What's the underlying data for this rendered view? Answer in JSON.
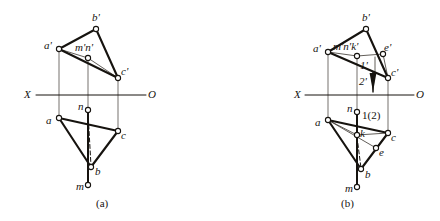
{
  "figure": {
    "ink_color": "#16130f",
    "thin_color": "#3a352e",
    "background": "#ffffff",
    "captions": [
      {
        "id": "cap-a",
        "text": "(a)",
        "x": 96,
        "y": 198
      },
      {
        "id": "cap-b",
        "text": "(b)",
        "x": 341,
        "y": 198
      }
    ]
  },
  "panels": [
    {
      "id": "panel-a",
      "caption": "(a)",
      "axis": {
        "label_left": "X",
        "label_right": "O",
        "y": 95,
        "x_start": 36,
        "x_end": 146,
        "label_left_x": 24,
        "label_left_y": 89,
        "label_right_x": 148,
        "label_right_y": 89
      },
      "upper_triangle": {
        "name": "frontal-projection-triangle",
        "vertices": [
          {
            "id": "a-prime",
            "label": "a'",
            "x": 59,
            "y": 49,
            "lx": 44,
            "ly": 40
          },
          {
            "id": "b-prime",
            "label": "b'",
            "x": 96,
            "y": 29,
            "lx": 92,
            "ly": 12
          },
          {
            "id": "c-prime",
            "label": "c'",
            "x": 118,
            "y": 78,
            "lx": 121,
            "ly": 66
          }
        ]
      },
      "lower_triangle": {
        "name": "horizontal-projection-triangle",
        "vertices": [
          {
            "id": "a-low",
            "label": "a",
            "x": 59,
            "y": 118,
            "lx": 46,
            "ly": 115
          },
          {
            "id": "b-low",
            "label": "b",
            "x": 91,
            "y": 167,
            "lx": 95,
            "ly": 166
          },
          {
            "id": "c-low",
            "label": "c",
            "x": 118,
            "y": 131,
            "lx": 121,
            "ly": 130
          }
        ]
      },
      "points": [
        {
          "id": "mn-prime",
          "label": "m'n'",
          "x": 88,
          "y": 58,
          "lx": 75,
          "ly": 42
        },
        {
          "id": "n-low",
          "label": "n",
          "x": 88,
          "y": 110,
          "lx": 78,
          "ly": 101
        },
        {
          "id": "m-low",
          "label": "m",
          "x": 88,
          "y": 185,
          "lx": 76,
          "ly": 181
        }
      ],
      "projection_lines": [
        {
          "id": "proj-a",
          "x": 59,
          "y1": 49,
          "y2": 118
        },
        {
          "id": "proj-mn",
          "x": 88,
          "y1": 58,
          "y2": 110
        },
        {
          "id": "proj-c",
          "x": 118,
          "y1": 78,
          "y2": 131
        }
      ],
      "solid_segments": [
        {
          "id": "seg-n-b",
          "x1": 88,
          "y1": 110,
          "x2": 88,
          "y2": 185
        }
      ],
      "dashed_segments": [
        {
          "id": "dash-n-b",
          "x1": 88,
          "y1": 112,
          "x2": 91,
          "y2": 166
        }
      ],
      "thin_segments": [
        {
          "id": "thin-aprime-mn-cprime",
          "pts": "59,49 88,58 118,78"
        }
      ]
    },
    {
      "id": "panel-b",
      "caption": "(b)",
      "axis": {
        "label_left": "X",
        "label_right": "O",
        "y": 95,
        "x_start": 305,
        "x_end": 414,
        "label_left_x": 294,
        "label_left_y": 89,
        "label_right_x": 416,
        "label_right_y": 89
      },
      "upper_triangle": {
        "name": "frontal-projection-triangle",
        "vertices": [
          {
            "id": "a-prime",
            "label": "a'",
            "x": 328,
            "y": 52,
            "lx": 313,
            "ly": 43
          },
          {
            "id": "b-prime",
            "label": "b'",
            "x": 366,
            "y": 29,
            "lx": 362,
            "ly": 12
          },
          {
            "id": "c-prime",
            "label": "c'",
            "x": 388,
            "y": 78,
            "lx": 391,
            "ly": 67
          }
        ]
      },
      "lower_triangle": {
        "name": "horizontal-projection-triangle",
        "vertices": [
          {
            "id": "a-low",
            "label": "a",
            "x": 328,
            "y": 120,
            "lx": 315,
            "ly": 117
          },
          {
            "id": "b-low",
            "label": "b",
            "x": 361,
            "y": 169,
            "lx": 365,
            "ly": 169
          },
          {
            "id": "c-low",
            "label": "c",
            "x": 388,
            "y": 133,
            "lx": 391,
            "ly": 132
          }
        ]
      },
      "points": [
        {
          "id": "mnk-prime",
          "label": "m'n'k'",
          "x": 357,
          "y": 56,
          "lx": 333,
          "ly": 41
        },
        {
          "id": "e-prime",
          "label": "e'",
          "x": 383,
          "y": 54,
          "lx": 384,
          "ly": 42
        },
        {
          "id": "n-low",
          "label": "n",
          "x": 357,
          "y": 112,
          "lx": 347,
          "ly": 103
        },
        {
          "id": "k-low",
          "label": "k",
          "x": 357,
          "y": 135,
          "lx": 360,
          "ly": 128
        },
        {
          "id": "e-low",
          "label": "e",
          "x": 376,
          "y": 148,
          "lx": 379,
          "ly": 147
        },
        {
          "id": "m-low",
          "label": "m",
          "x": 357,
          "y": 187,
          "lx": 345,
          "ly": 183
        }
      ],
      "annotations": [
        {
          "id": "ann-1-prime",
          "label": "1'",
          "x": 360,
          "y": 64
        },
        {
          "id": "ann-2-prime",
          "label": "2'",
          "x": 359,
          "y": 80
        },
        {
          "id": "ann-1-2",
          "label": "1(2)",
          "x": 362,
          "y": 114
        }
      ],
      "projection_lines": [
        {
          "id": "proj-a",
          "x": 328,
          "y1": 52,
          "y2": 120
        },
        {
          "id": "proj-mnk",
          "x": 357,
          "y1": 56,
          "y2": 112
        },
        {
          "id": "proj-c",
          "x": 388,
          "y1": 78,
          "y2": 133
        }
      ],
      "solid_segments": [
        {
          "id": "seg-n-b",
          "x1": 357,
          "y1": 112,
          "x2": 357,
          "y2": 187
        }
      ],
      "dashed_segments": [
        {
          "id": "dash-k-b",
          "x1": 357,
          "y1": 137,
          "x2": 361,
          "y2": 168
        }
      ],
      "thin_segments": [
        {
          "id": "thin-aprime-mnk-eprime",
          "pts": "328,52 357,56 383,54"
        },
        {
          "id": "thin-a-k-c",
          "pts": "328,120 357,135 388,133"
        },
        {
          "id": "thin-a-e",
          "pts": "328,120 376,148"
        },
        {
          "id": "thin-e-c",
          "pts": "376,148 388,133"
        },
        {
          "id": "thin-eprime-cprime",
          "pts": "383,54 388,78"
        },
        {
          "id": "thin-vert-1",
          "pts": "375,57 375,72"
        }
      ],
      "arrow": {
        "id": "visibility-arrow",
        "x": 373,
        "y1": 72,
        "y2": 92
      }
    }
  ]
}
